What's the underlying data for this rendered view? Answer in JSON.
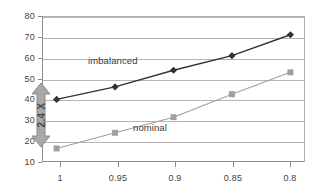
{
  "chart_data": {
    "type": "line",
    "title": "",
    "subtitle": "",
    "xlabel": "",
    "ylabel": "",
    "x": [
      1,
      0.95,
      0.9,
      0.85,
      0.8
    ],
    "xticklabels": [
      "1",
      "0.95",
      "0.9",
      "0.85",
      "0.8"
    ],
    "xlim": [
      1.0125,
      0.7875
    ],
    "x_axis_direction": "descending",
    "ylim": [
      10,
      80
    ],
    "yticks": [
      10,
      20,
      30,
      40,
      50,
      60,
      70,
      80
    ],
    "yticklabels": [
      "10",
      "20",
      "30",
      "40",
      "50",
      "60",
      "70",
      "80"
    ],
    "grid": "horizontal",
    "legend": "inline-labels",
    "series": [
      {
        "name": "imbalanced",
        "color": "#333333",
        "marker": "diamond",
        "values": [
          40,
          46,
          54,
          61,
          71
        ]
      },
      {
        "name": "nominal",
        "color": "#a0a0a0",
        "marker": "square",
        "values": [
          16.5,
          24,
          31.5,
          42.5,
          53
        ]
      }
    ],
    "annotations": [
      {
        "name": "ratio-arrow",
        "text": "2.4 X",
        "type": "double-headed-vertical-arrow",
        "at_x": 1,
        "y_from": 19,
        "y_to": 40,
        "color": "#9a9a9a",
        "rotation": -90
      }
    ]
  },
  "labels": {
    "imbalanced": "imbalanced",
    "nominal": "nominal",
    "annotation": "2.4 X"
  },
  "axes": {
    "y": [
      "80",
      "70",
      "60",
      "50",
      "40",
      "30",
      "20",
      "10"
    ],
    "x": [
      "1",
      "0.95",
      "0.9",
      "0.85",
      "0.8"
    ]
  },
  "colors": {
    "imbalanced": "#333333",
    "nominal": "#a0a0a0",
    "grid": "#b5b5b5",
    "axis": "#8c8c8c",
    "annotation": "#9a9a9a",
    "text": "#444444",
    "background": "#ffffff"
  }
}
